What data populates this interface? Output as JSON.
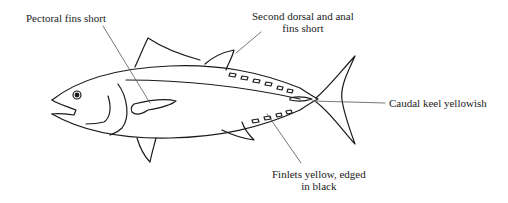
{
  "diagram": {
    "labels": [
      {
        "id": "pectoral",
        "text": "Pectoral fins short"
      },
      {
        "id": "dorsal",
        "line1": "Second dorsal and anal",
        "line2": "fins short"
      },
      {
        "id": "keel",
        "text": "Caudal keel yellowish"
      },
      {
        "id": "finlets",
        "line1": "Finlets yellow, edged",
        "line2": "in black"
      }
    ],
    "colors": {
      "stroke": "#1a1a1a",
      "background": "#ffffff"
    }
  }
}
